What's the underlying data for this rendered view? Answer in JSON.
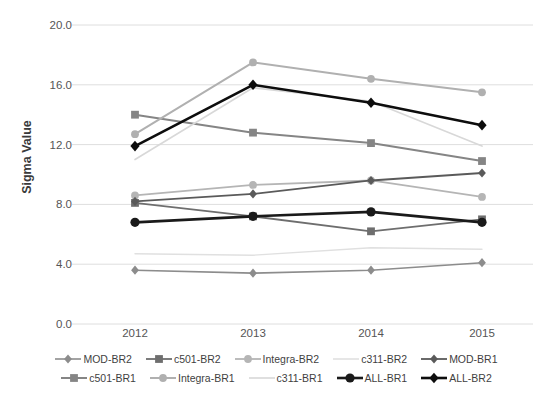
{
  "chart_data": {
    "type": "line",
    "title": "",
    "xlabel": "",
    "ylabel": "Sigma Value",
    "categories": [
      "2012",
      "2013",
      "2014",
      "2015"
    ],
    "ylim": [
      0.0,
      20.0
    ],
    "yticks": [
      "0.0",
      "4.0",
      "8.0",
      "12.0",
      "16.0",
      "20.0"
    ],
    "ytick_values": [
      0.0,
      4.0,
      8.0,
      12.0,
      16.0,
      20.0
    ],
    "grid": true,
    "legend_position": "bottom",
    "series": [
      {
        "name": "MOD-BR2",
        "values": [
          3.6,
          3.4,
          3.6,
          4.1
        ],
        "color": "#8c8c8c",
        "marker": "diamond",
        "width": 1.6
      },
      {
        "name": "c501-BR2",
        "values": [
          8.1,
          7.2,
          6.2,
          7.0
        ],
        "color": "#6e6e6e",
        "marker": "square",
        "width": 1.8
      },
      {
        "name": "Integra-BR2",
        "values": [
          8.6,
          9.3,
          9.6,
          8.5
        ],
        "color": "#b5b5b5",
        "marker": "circle",
        "width": 1.8
      },
      {
        "name": "c311-BR2",
        "values": [
          4.7,
          4.6,
          5.1,
          5.0
        ],
        "color": "#e0e0e0",
        "marker": "none",
        "width": 1.4
      },
      {
        "name": "MOD-BR1",
        "values": [
          8.2,
          8.7,
          9.6,
          10.1
        ],
        "color": "#5a5a5a",
        "marker": "diamond",
        "width": 1.8
      },
      {
        "name": "c501-BR1",
        "values": [
          14.0,
          12.8,
          12.1,
          10.9
        ],
        "color": "#858585",
        "marker": "square",
        "width": 2.0
      },
      {
        "name": "Integra-BR1",
        "values": [
          12.7,
          17.5,
          16.4,
          15.5
        ],
        "color": "#b0b0b0",
        "marker": "circle",
        "width": 2.0
      },
      {
        "name": "c311-BR1",
        "values": [
          11.0,
          15.8,
          14.9,
          11.9
        ],
        "color": "#d8d8d8",
        "marker": "none",
        "width": 1.6
      },
      {
        "name": "ALL-BR1",
        "values": [
          6.8,
          7.2,
          7.5,
          6.8
        ],
        "color": "#1a1a1a",
        "marker": "circle",
        "width": 2.6
      },
      {
        "name": "ALL-BR2",
        "values": [
          11.9,
          16.0,
          14.8,
          13.3
        ],
        "color": "#0d0d0d",
        "marker": "diamond",
        "width": 2.6
      }
    ]
  },
  "axes": {
    "plot_left": 72,
    "plot_right": 533,
    "plot_top": 25,
    "plot_bottom": 324,
    "category_x": [
      135,
      253,
      371,
      482
    ]
  },
  "colors": {
    "gridline": "#dedede",
    "axis_text": "#555555",
    "label_text": "#3a3a3a",
    "background": "#ffffff"
  }
}
